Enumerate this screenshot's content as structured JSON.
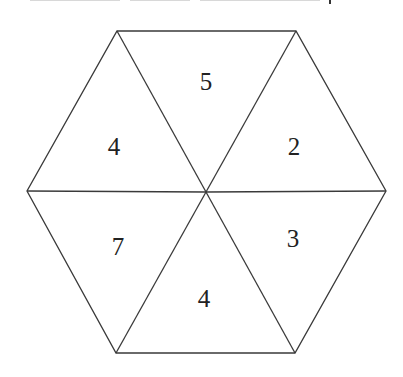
{
  "diagram": {
    "type": "hexagon divided into six triangles",
    "center": [
      206,
      192
    ],
    "vertices": [
      [
        117,
        31
      ],
      [
        296,
        31
      ],
      [
        386,
        191
      ],
      [
        295,
        353
      ],
      [
        116,
        353
      ],
      [
        27,
        191
      ]
    ],
    "stroke_color": "#3a3a3a",
    "fill_color": "#ffffff",
    "triangles": [
      {
        "position": "top",
        "value": "5",
        "label_xy": [
          206,
          81
        ]
      },
      {
        "position": "upper-right",
        "value": "2",
        "label_xy": [
          294,
          146
        ]
      },
      {
        "position": "lower-right",
        "value": "3",
        "label_xy": [
          293,
          238
        ]
      },
      {
        "position": "bottom",
        "value": "4",
        "label_xy": [
          204,
          298
        ]
      },
      {
        "position": "lower-left",
        "value": "7",
        "label_xy": [
          118,
          246
        ]
      },
      {
        "position": "upper-left",
        "value": "4",
        "label_xy": [
          114,
          146
        ]
      }
    ]
  }
}
